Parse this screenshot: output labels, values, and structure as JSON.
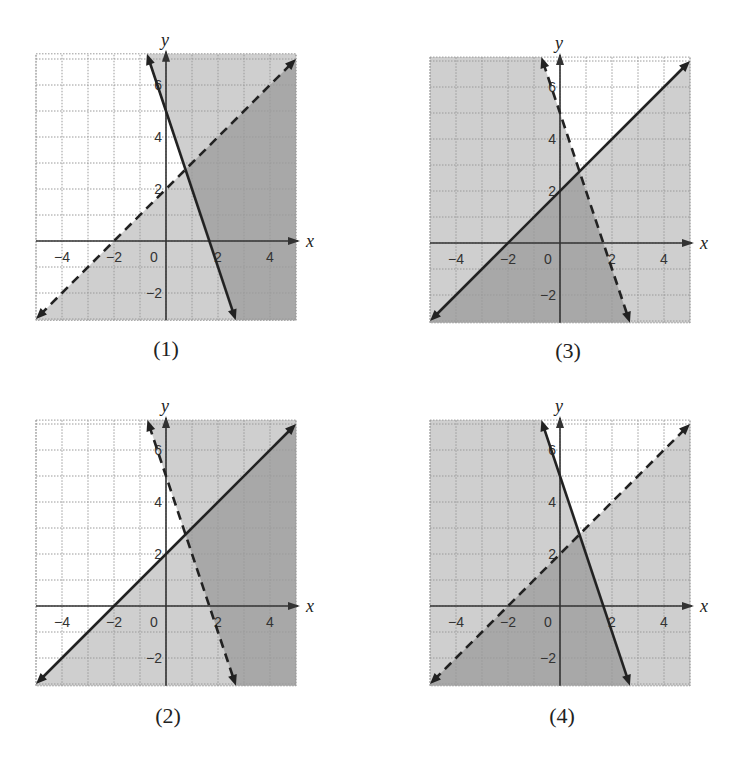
{
  "figure": {
    "scale_px_per_unit": 26,
    "x_range": [
      -5,
      5
    ],
    "colors": {
      "background": "#ffffff",
      "grid": "#9a9a9a",
      "axis": "#333333",
      "line": "#222222",
      "shade_single": "#cfcfcf",
      "shade_double": "#a5a5a5"
    },
    "lines": {
      "L1": {
        "equation": "y = x + 2",
        "m": 1,
        "b": 2
      },
      "L2": {
        "equation": "y = -3x + 5",
        "m": -3,
        "b": 5
      }
    }
  },
  "graphs": [
    {
      "id": "g1",
      "caption": "(1)",
      "origin_px": [
        166,
        241
      ],
      "y_range": [
        -3.05,
        7.2
      ],
      "caption_px": [
        166,
        336
      ],
      "x_axis_label": "x",
      "y_axis_label": "y",
      "x_tick_labels": [
        "−4",
        "−2",
        "0",
        "2",
        "4"
      ],
      "y_tick_labels": [
        "−2",
        "2",
        "4",
        "6"
      ],
      "L1_style": "dashed",
      "L2_style": "solid",
      "shade": {
        "L1": "below",
        "L2": "above"
      }
    },
    {
      "id": "g3",
      "caption": "(3)",
      "origin_px": [
        560,
        243
      ],
      "y_range": [
        -3.07,
        7.15
      ],
      "caption_px": [
        568,
        338
      ],
      "x_axis_label": "x",
      "y_axis_label": "y",
      "x_tick_labels": [
        "−4",
        "−2",
        "0",
        "2",
        "4"
      ],
      "y_tick_labels": [
        "−2",
        "2",
        "4",
        "6"
      ],
      "L1_style": "solid",
      "L2_style": "dashed",
      "shade": {
        "L1": "below",
        "L2": "below"
      }
    },
    {
      "id": "g2",
      "caption": "(2)",
      "origin_px": [
        166,
        606
      ],
      "y_range": [
        -3.07,
        7.15
      ],
      "caption_px": [
        168,
        703
      ],
      "x_axis_label": "x",
      "y_axis_label": "y",
      "x_tick_labels": [
        "−4",
        "−2",
        "0",
        "2",
        "4"
      ],
      "y_tick_labels": [
        "−2",
        "2",
        "4",
        "6"
      ],
      "L1_style": "solid",
      "L2_style": "dashed",
      "shade": {
        "L1": "below",
        "L2": "above"
      }
    },
    {
      "id": "g4",
      "caption": "(4)",
      "origin_px": [
        560,
        606
      ],
      "y_range": [
        -3.07,
        7.15
      ],
      "caption_px": [
        562,
        703
      ],
      "x_axis_label": "x",
      "y_axis_label": "y",
      "x_tick_labels": [
        "−4",
        "−2",
        "0",
        "2",
        "4"
      ],
      "y_tick_labels": [
        "−2",
        "2",
        "4",
        "6"
      ],
      "L1_style": "dashed",
      "L2_style": "solid",
      "shade": {
        "L1": "below",
        "L2": "below"
      }
    }
  ],
  "chart_data": [
    {
      "type": "line",
      "title": "(1)",
      "xlabel": "x",
      "ylabel": "y",
      "xlim": [
        -5,
        5
      ],
      "ylim": [
        -3,
        7
      ],
      "grid": true,
      "x_ticks": [
        -4,
        -2,
        0,
        2,
        4
      ],
      "y_ticks": [
        -2,
        2,
        4,
        6
      ],
      "series": [
        {
          "name": "y = x + 2",
          "style": "dashed",
          "points": [
            [
              -5,
              -3
            ],
            [
              5,
              7
            ]
          ],
          "shaded_side": "below"
        },
        {
          "name": "y = -3x + 5",
          "style": "solid",
          "points": [
            [
              -0.67,
              7
            ],
            [
              2.67,
              -3
            ]
          ],
          "shaded_side": "above"
        }
      ],
      "intersection": [
        0.75,
        2.75
      ],
      "solution_region": "y < x + 2 and y >= -3x + 5"
    },
    {
      "type": "line",
      "title": "(2)",
      "xlabel": "x",
      "ylabel": "y",
      "xlim": [
        -5,
        5
      ],
      "ylim": [
        -3,
        7
      ],
      "grid": true,
      "x_ticks": [
        -4,
        -2,
        0,
        2,
        4
      ],
      "y_ticks": [
        -2,
        2,
        4,
        6
      ],
      "series": [
        {
          "name": "y = x + 2",
          "style": "solid",
          "points": [
            [
              -5,
              -3
            ],
            [
              5,
              7
            ]
          ],
          "shaded_side": "below"
        },
        {
          "name": "y = -3x + 5",
          "style": "dashed",
          "points": [
            [
              -0.67,
              7
            ],
            [
              2.67,
              -3
            ]
          ],
          "shaded_side": "above"
        }
      ],
      "intersection": [
        0.75,
        2.75
      ],
      "solution_region": "y <= x + 2 and y > -3x + 5"
    },
    {
      "type": "line",
      "title": "(3)",
      "xlabel": "x",
      "ylabel": "y",
      "xlim": [
        -5,
        5
      ],
      "ylim": [
        -3,
        7
      ],
      "grid": true,
      "x_ticks": [
        -4,
        -2,
        0,
        2,
        4
      ],
      "y_ticks": [
        -2,
        2,
        4,
        6
      ],
      "series": [
        {
          "name": "y = x + 2",
          "style": "solid",
          "points": [
            [
              -5,
              -3
            ],
            [
              5,
              7
            ]
          ],
          "shaded_side": "below"
        },
        {
          "name": "y = -3x + 5",
          "style": "dashed",
          "points": [
            [
              -0.67,
              7
            ],
            [
              2.67,
              -3
            ]
          ],
          "shaded_side": "below"
        }
      ],
      "intersection": [
        0.75,
        2.75
      ],
      "solution_region": "y <= x + 2 and y < -3x + 5"
    },
    {
      "type": "line",
      "title": "(4)",
      "xlabel": "x",
      "ylabel": "y",
      "xlim": [
        -5,
        5
      ],
      "ylim": [
        -3,
        7
      ],
      "grid": true,
      "x_ticks": [
        -4,
        -2,
        0,
        2,
        4
      ],
      "y_ticks": [
        -2,
        2,
        4,
        6
      ],
      "series": [
        {
          "name": "y = x + 2",
          "style": "dashed",
          "points": [
            [
              -5,
              -3
            ],
            [
              5,
              7
            ]
          ],
          "shaded_side": "below"
        },
        {
          "name": "y = -3x + 5",
          "style": "solid",
          "points": [
            [
              -0.67,
              7
            ],
            [
              2.67,
              -3
            ]
          ],
          "shaded_side": "below"
        }
      ],
      "intersection": [
        0.75,
        2.75
      ],
      "solution_region": "y < x + 2 and y <= -3x + 5"
    }
  ]
}
